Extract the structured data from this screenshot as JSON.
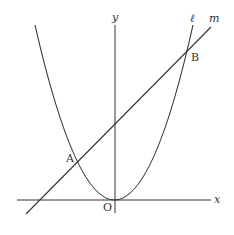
{
  "diagram": {
    "type": "coordinate-graph",
    "axes": {
      "x_label": "x",
      "y_label": "y",
      "origin_label": "O"
    },
    "curves": [
      {
        "name": "ℓ",
        "kind": "parabola",
        "label": "ℓ"
      },
      {
        "name": "m",
        "kind": "line",
        "label": "m"
      }
    ],
    "points": [
      {
        "label": "A"
      },
      {
        "label": "B"
      }
    ],
    "colors": {
      "stroke": "#333333",
      "background": "#ffffff"
    }
  }
}
